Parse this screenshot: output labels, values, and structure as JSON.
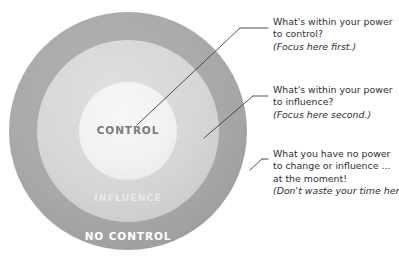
{
  "diagram": {
    "rings": [
      {
        "id": "control",
        "label": "CONTROL",
        "fill": "#f2f2f2",
        "text_color": "#7b7b7b"
      },
      {
        "id": "influence",
        "label": "INFLUENCE",
        "fill": "#d9d9d9",
        "text_color": "#e9e9e9"
      },
      {
        "id": "no-control",
        "label": "NO CONTROL",
        "fill": "#a6a6a6",
        "text_color": "#ffffff"
      }
    ],
    "background_color": "#ffffff",
    "leader_line_color": "#3d3d3d"
  },
  "annotations": [
    {
      "id": "control-note",
      "target_ring": "control",
      "lines": [
        "What's within your power",
        "to control?"
      ],
      "aside": "(Focus here first.)"
    },
    {
      "id": "influence-note",
      "target_ring": "influence",
      "lines": [
        "What's within your power",
        "to influence?"
      ],
      "aside": "(Focus here second.)"
    },
    {
      "id": "no-control-note",
      "target_ring": "no-control",
      "lines": [
        "What you have no power",
        "to change or influence ...",
        "at the moment!"
      ],
      "aside": "(Don't waste your time here.)"
    }
  ]
}
